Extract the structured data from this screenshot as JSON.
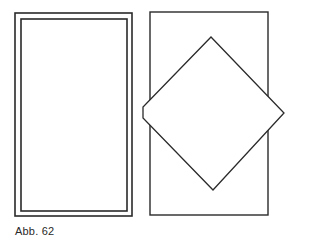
{
  "caption": "Abb. 62",
  "colors": {
    "stroke": "#2a2a2a",
    "background": "#ffffff"
  },
  "figures": [
    {
      "name": "double-frame-rectangle",
      "outer": {
        "x": 15,
        "y": 13,
        "w": 117,
        "h": 203
      },
      "inner": {
        "x": 21,
        "y": 19,
        "w": 106,
        "h": 192
      }
    },
    {
      "name": "rectangle-with-diamond",
      "rect": {
        "x": 150,
        "y": 12,
        "w": 118,
        "h": 203
      },
      "diamond_points": [
        [
          211,
          37
        ],
        [
          284,
          113
        ],
        [
          213,
          190
        ],
        [
          143,
          118
        ],
        [
          143,
          107
        ]
      ]
    }
  ]
}
